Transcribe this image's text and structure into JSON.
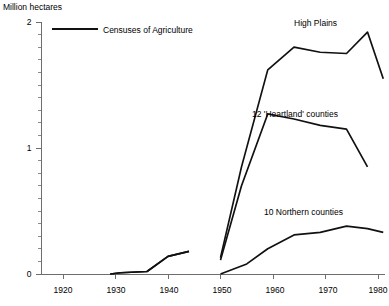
{
  "chart_data": {
    "type": "line",
    "title": "",
    "ylabel": "Million hectares",
    "xlabel": "",
    "xlim": [
      1915,
      1982
    ],
    "ylim": [
      0,
      2
    ],
    "grid": false,
    "legend_position": "top-left-inside",
    "legend": [
      {
        "name": "Censuses of Agriculture",
        "marker": "solid-line"
      }
    ],
    "y_ticks": [
      0,
      1,
      2
    ],
    "y_tick_labels": [
      "0",
      "1",
      "2"
    ],
    "y_minor_tick_step": 0.1,
    "x_ticks": [
      1920,
      1930,
      1940,
      1950,
      1960,
      1970,
      1980
    ],
    "x_tick_labels": [
      "1920",
      "1930",
      "1940",
      "1950",
      "1960",
      "1970",
      "1980"
    ],
    "annotations": [
      {
        "text": "High Plains",
        "x": 1962,
        "y": 1.93
      },
      {
        "text": "12 'Heartland' counties",
        "x": 1957,
        "y": 1.33
      },
      {
        "text": "10 Northern counties",
        "x": 1959,
        "y": 0.56
      }
    ],
    "series": [
      {
        "name": "High Plains",
        "segments": [
          {
            "x": [
              1929,
              1931,
              1936,
              1940,
              1944
            ],
            "y": [
              0.0,
              0.01,
              0.02,
              0.14,
              0.18
            ]
          },
          {
            "x": [
              1950,
              1954,
              1959,
              1964,
              1969,
              1974,
              1978,
              1981
            ],
            "y": [
              0.13,
              0.85,
              1.62,
              1.8,
              1.76,
              1.75,
              1.92,
              1.55
            ]
          }
        ]
      },
      {
        "name": "12 'Heartland' counties",
        "segments": [
          {
            "x": [
              1929,
              1931,
              1936,
              1940,
              1944
            ],
            "y": [
              0.0,
              0.01,
              0.02,
              0.14,
              0.18
            ]
          },
          {
            "x": [
              1950,
              1954,
              1959,
              1964,
              1969,
              1974,
              1978
            ],
            "y": [
              0.11,
              0.7,
              1.27,
              1.23,
              1.18,
              1.15,
              0.85
            ]
          }
        ]
      },
      {
        "name": "10 Northern counties",
        "segments": [
          {
            "x": [
              1950,
              1955,
              1959,
              1964,
              1969,
              1974,
              1978,
              1981
            ],
            "y": [
              0.0,
              0.08,
              0.2,
              0.31,
              0.33,
              0.38,
              0.36,
              0.33
            ]
          }
        ]
      }
    ]
  },
  "labels": {
    "y_axis_title": "Million hectares",
    "legend_entry": "Censuses of Agriculture",
    "series_high_plains": "High Plains",
    "series_heartland": "12 'Heartland' counties",
    "series_northern": "10 Northern counties",
    "y0": "0",
    "y1": "1",
    "y2": "2",
    "x1920": "1920",
    "x1930": "1930",
    "x1940": "1940",
    "x1950": "1950",
    "x1960": "1960",
    "x1970": "1970",
    "x1980": "1980"
  }
}
